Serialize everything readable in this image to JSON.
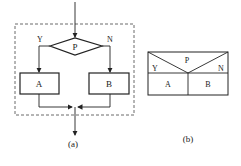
{
  "figure_a": {
    "caption": "(a)",
    "decision": "P",
    "yes_label": "Y",
    "no_label": "N",
    "process_a": "A",
    "process_b": "B"
  },
  "figure_b": {
    "caption": "(b)",
    "condition": "P",
    "yes_label": "Y",
    "no_label": "N",
    "process_a": "A",
    "process_b": "B"
  },
  "colors": {
    "stroke": "#222222",
    "background": "#ffffff"
  }
}
